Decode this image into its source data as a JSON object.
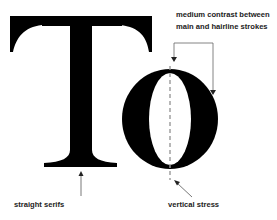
{
  "diagram": {
    "letters": "To",
    "letter_T": "T",
    "letter_o": "o",
    "annotations": {
      "contrast_line1": "medium contrast between",
      "contrast_line2": "main and hairline strokes",
      "serifs": "straight serifs",
      "stress": "vertical stress"
    },
    "colors": {
      "glyph": "#000000",
      "annotation_text": "#222222",
      "arrow": "#555555",
      "stress_axis": "#999999"
    }
  }
}
